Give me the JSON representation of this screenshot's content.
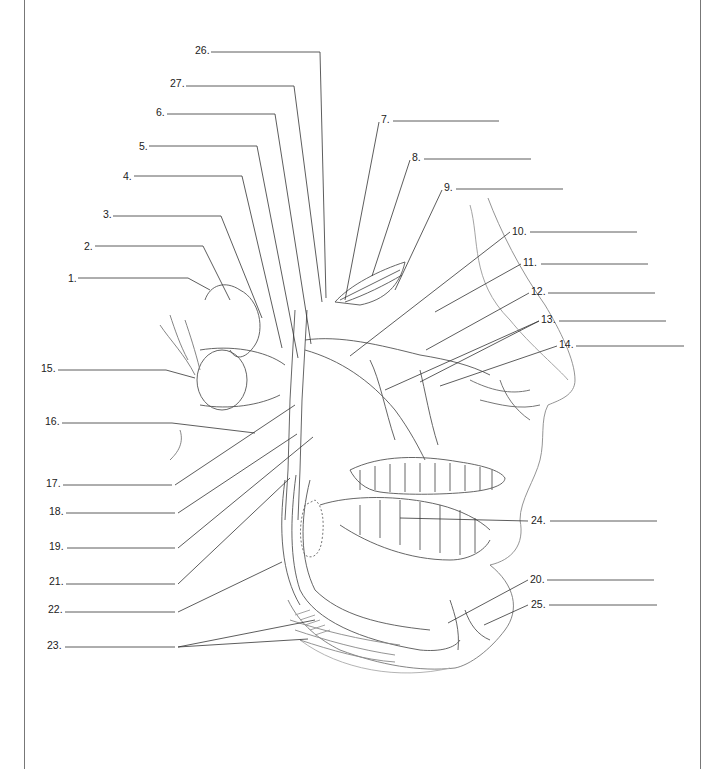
{
  "diagram": {
    "labels": [
      {
        "id": "1",
        "text": "1.",
        "x": 68,
        "y": 272,
        "line": [
          78,
          278,
          188,
          278
        ],
        "leader": [
          [
            188,
            278
          ],
          [
            210,
            290
          ]
        ]
      },
      {
        "id": "2",
        "text": "2.",
        "x": 84,
        "y": 240,
        "line": [
          95,
          246,
          203,
          246
        ],
        "leader": [
          [
            203,
            246
          ],
          [
            230,
            300
          ]
        ]
      },
      {
        "id": "3",
        "text": "3.",
        "x": 103,
        "y": 208,
        "line": [
          113,
          216,
          221,
          216
        ],
        "leader": [
          [
            221,
            216
          ],
          [
            262,
            318
          ]
        ]
      },
      {
        "id": "4",
        "text": "4.",
        "x": 123,
        "y": 170,
        "line": [
          134,
          176,
          242,
          176
        ],
        "leader": [
          [
            242,
            176
          ],
          [
            282,
            348
          ]
        ]
      },
      {
        "id": "5",
        "text": "5.",
        "x": 139,
        "y": 140,
        "line": [
          149,
          146,
          257,
          146
        ],
        "leader": [
          [
            257,
            146
          ],
          [
            298,
            358
          ]
        ]
      },
      {
        "id": "6",
        "text": "6.",
        "x": 156,
        "y": 106,
        "line": [
          167,
          114,
          275,
          114
        ],
        "leader": [
          [
            275,
            114
          ],
          [
            311,
            344
          ]
        ]
      },
      {
        "id": "27",
        "text": "27.",
        "x": 170,
        "y": 77,
        "line": [
          186,
          86,
          294,
          86
        ],
        "leader": [
          [
            294,
            86
          ],
          [
            322,
            302
          ]
        ]
      },
      {
        "id": "26",
        "text": "26.",
        "x": 195,
        "y": 44,
        "line": [
          211,
          52,
          320,
          52
        ],
        "leader": [
          [
            320,
            52
          ],
          [
            326,
            298
          ]
        ]
      },
      {
        "id": "7",
        "text": "7.",
        "x": 381,
        "y": 113,
        "line": [
          393,
          121,
          499,
          121
        ],
        "leader": [
          [
            379,
            122
          ],
          [
            345,
            300
          ]
        ]
      },
      {
        "id": "8",
        "text": "8.",
        "x": 412,
        "y": 151,
        "line": [
          424,
          159,
          531,
          159
        ],
        "leader": [
          [
            410,
            160
          ],
          [
            372,
            276
          ]
        ]
      },
      {
        "id": "9",
        "text": "9.",
        "x": 444,
        "y": 181,
        "line": [
          456,
          189,
          563,
          189
        ],
        "leader": [
          [
            442,
            190
          ],
          [
            395,
            290
          ]
        ]
      },
      {
        "id": "10",
        "text": "10.",
        "x": 512,
        "y": 225,
        "line": [
          530,
          232,
          637,
          232
        ],
        "leader": [
          [
            510,
            232
          ],
          [
            350,
            356
          ]
        ]
      },
      {
        "id": "11",
        "text": "11.",
        "x": 523,
        "y": 256,
        "line": [
          541,
          264,
          648,
          264
        ],
        "leader": [
          [
            521,
            264
          ],
          [
            435,
            312
          ]
        ]
      },
      {
        "id": "12",
        "text": "12.",
        "x": 531,
        "y": 285,
        "line": [
          548,
          293,
          655,
          293
        ],
        "leader": [
          [
            529,
            293
          ],
          [
            426,
            350
          ]
        ]
      },
      {
        "id": "13",
        "text": "13.",
        "x": 541,
        "y": 313,
        "line": [
          559,
          321,
          666,
          321
        ],
        "leader": [
          [
            539,
            321
          ],
          [
            385,
            390
          ]
        ],
        "leader2": [
          [
            539,
            321
          ],
          [
            420,
            382
          ]
        ]
      },
      {
        "id": "14",
        "text": "14.",
        "x": 559,
        "y": 338,
        "line": [
          576,
          346,
          684,
          346
        ],
        "leader": [
          [
            557,
            346
          ],
          [
            440,
            386
          ]
        ]
      },
      {
        "id": "15",
        "text": "15.",
        "x": 41,
        "y": 362,
        "line": [
          58,
          370,
          166,
          370
        ],
        "leader": [
          [
            166,
            370
          ],
          [
            195,
            378
          ]
        ]
      },
      {
        "id": "16",
        "text": "16.",
        "x": 45,
        "y": 415,
        "line": [
          62,
          423,
          172,
          423
        ],
        "leader": [
          [
            172,
            423
          ],
          [
            255,
            433
          ]
        ]
      },
      {
        "id": "17",
        "text": "17.",
        "x": 46,
        "y": 477,
        "line": [
          63,
          485,
          172,
          485
        ],
        "leader": [
          [
            175,
            485
          ],
          [
            295,
            405
          ]
        ]
      },
      {
        "id": "18",
        "text": "18.",
        "x": 49,
        "y": 505,
        "line": [
          66,
          513,
          175,
          513
        ],
        "leader": [
          [
            178,
            513
          ],
          [
            297,
            434
          ]
        ]
      },
      {
        "id": "19",
        "text": "19.",
        "x": 49,
        "y": 540,
        "line": [
          67,
          548,
          175,
          548
        ],
        "leader": [
          [
            178,
            548
          ],
          [
            313,
            437
          ]
        ]
      },
      {
        "id": "21",
        "text": "21.",
        "x": 49,
        "y": 575,
        "line": [
          66,
          584,
          175,
          584
        ],
        "leader": [
          [
            178,
            584
          ],
          [
            290,
            478
          ]
        ]
      },
      {
        "id": "22",
        "text": "22.",
        "x": 48,
        "y": 603,
        "line": [
          65,
          612,
          175,
          612
        ],
        "leader": [
          [
            178,
            612
          ],
          [
            282,
            562
          ]
        ]
      },
      {
        "id": "23",
        "text": "23.",
        "x": 47,
        "y": 639,
        "line": [
          65,
          647,
          175,
          647
        ],
        "leader": [
          [
            178,
            647
          ],
          [
            315,
            620
          ]
        ],
        "leader2": [
          [
            178,
            647
          ],
          [
            308,
            639
          ]
        ]
      },
      {
        "id": "24",
        "text": "24.",
        "x": 531,
        "y": 514,
        "line": [
          550,
          521,
          657,
          521
        ],
        "leader": [
          [
            528,
            521
          ],
          [
            400,
            518
          ]
        ]
      },
      {
        "id": "20",
        "text": "20.",
        "x": 530,
        "y": 573,
        "line": [
          547,
          580,
          654,
          580
        ],
        "leader": [
          [
            528,
            580
          ],
          [
            448,
            623
          ]
        ]
      },
      {
        "id": "25",
        "text": "25.",
        "x": 531,
        "y": 598,
        "line": [
          549,
          605,
          657,
          605
        ],
        "leader": [
          [
            528,
            605
          ],
          [
            484,
            625
          ]
        ]
      }
    ]
  },
  "colors": {
    "background": "#ffffff",
    "line": "#333333",
    "soft_line": "#888888",
    "frame": "#777777",
    "text": "#222222"
  }
}
